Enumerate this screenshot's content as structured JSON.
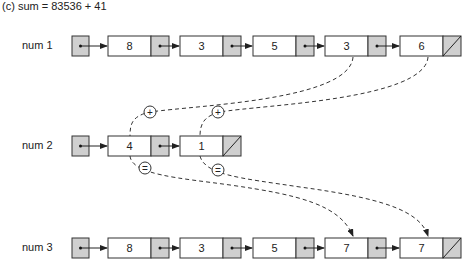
{
  "caption": "(c) sum = 83536 + 41",
  "rows": [
    {
      "label": "num 1",
      "nodes": [
        "8",
        "3",
        "5",
        "3",
        "6"
      ]
    },
    {
      "label": "num 2",
      "nodes": [
        "4",
        "1"
      ]
    },
    {
      "label": "num 3",
      "nodes": [
        "8",
        "3",
        "5",
        "7",
        "7"
      ]
    }
  ],
  "operators": {
    "plus": "+",
    "equals": "="
  },
  "colors": {
    "pointer_fill": "#cfcfcf",
    "stroke": "#333333"
  }
}
